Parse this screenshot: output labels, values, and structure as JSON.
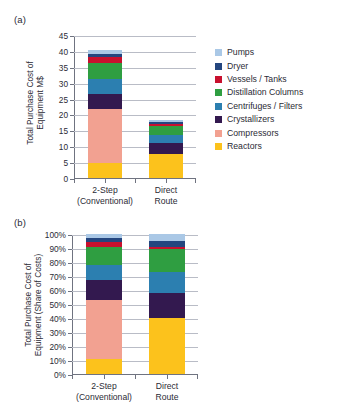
{
  "figure": {
    "panel_a_label": "(a)",
    "panel_b_label": "(b)"
  },
  "legend": {
    "items": [
      {
        "label": "Pumps",
        "color": "#aac8e6"
      },
      {
        "label": "Dryer",
        "color": "#24467f"
      },
      {
        "label": "Vessels / Tanks",
        "color": "#c8102e"
      },
      {
        "label": "Distillation Columns",
        "color": "#2f9e41"
      },
      {
        "label": "Centrifuges / Filters",
        "color": "#2c7fb0"
      },
      {
        "label": "Crystallizers",
        "color": "#33194f"
      },
      {
        "label": "Compressors",
        "color": "#f2a191"
      },
      {
        "label": "Reactors",
        "color": "#fcc21c"
      }
    ]
  },
  "chart_data": [
    {
      "type": "bar",
      "id": "panel-a",
      "title": "(a)",
      "stacked": true,
      "xlabel": "",
      "ylabel": "Total Purchase Cost of Equipment M$",
      "ylabel_lines": [
        "Total Purchase Cost of",
        "Equipment M$"
      ],
      "categories": [
        "2-Step (Conventional)",
        "Direct Route"
      ],
      "category_lines": [
        [
          "2-Step",
          "(Conventional)"
        ],
        [
          "Direct",
          "Route"
        ]
      ],
      "ylim": [
        0,
        45
      ],
      "yticks": [
        0,
        5,
        10,
        15,
        20,
        25,
        30,
        35,
        40,
        45
      ],
      "ytick_labels": [
        "0",
        "5",
        "10",
        "15",
        "20",
        "25",
        "30",
        "35",
        "40",
        "45"
      ],
      "grid": true,
      "legend_position": "right",
      "series": [
        {
          "name": "Reactors",
          "color": "#fcc21c",
          "values": [
            4.7,
            7.5
          ]
        },
        {
          "name": "Compressors",
          "color": "#f2a191",
          "values": [
            17.0,
            0.0
          ]
        },
        {
          "name": "Crystallizers",
          "color": "#33194f",
          "values": [
            4.8,
            3.5
          ]
        },
        {
          "name": "Centrifuges / Filters",
          "color": "#2c7fb0",
          "values": [
            4.7,
            2.6
          ]
        },
        {
          "name": "Distillation Columns",
          "color": "#2f9e41",
          "values": [
            5.1,
            2.9
          ]
        },
        {
          "name": "Vessels / Tanks",
          "color": "#c8102e",
          "values": [
            1.7,
            0.5
          ]
        },
        {
          "name": "Dryer",
          "color": "#24467f",
          "values": [
            1.1,
            0.6
          ]
        },
        {
          "name": "Pumps",
          "color": "#aac8e6",
          "values": [
            1.2,
            0.8
          ]
        }
      ],
      "totals": [
        40.3,
        18.4
      ]
    },
    {
      "type": "bar",
      "id": "panel-b",
      "title": "(b)",
      "stacked": true,
      "xlabel": "",
      "ylabel": "Total Purchase Cost of Equipment (Share of Costs)",
      "ylabel_lines": [
        "Total Purchase Cost of",
        "Equipment (Share of Costs)"
      ],
      "categories": [
        "2-Step (Conventional)",
        "Direct Route"
      ],
      "category_lines": [
        [
          "2-Step",
          "(Conventional)"
        ],
        [
          "Direct",
          "Route"
        ]
      ],
      "ylim": [
        0,
        100
      ],
      "yticks": [
        0,
        10,
        20,
        30,
        40,
        50,
        60,
        70,
        80,
        90,
        100
      ],
      "ytick_labels": [
        "0%",
        "10%",
        "20%",
        "30%",
        "40%",
        "50%",
        "60%",
        "70%",
        "80%",
        "90%",
        "100%"
      ],
      "grid": true,
      "legend_position": "right",
      "series": [
        {
          "name": "Reactors",
          "color": "#fcc21c",
          "values": [
            11.0,
            40.0
          ]
        },
        {
          "name": "Compressors",
          "color": "#f2a191",
          "values": [
            42.0,
            0.0
          ]
        },
        {
          "name": "Crystallizers",
          "color": "#33194f",
          "values": [
            14.0,
            18.0
          ]
        },
        {
          "name": "Centrifuges / Filters",
          "color": "#2c7fb0",
          "values": [
            11.0,
            15.0
          ]
        },
        {
          "name": "Distillation Columns",
          "color": "#2f9e41",
          "values": [
            13.0,
            16.0
          ]
        },
        {
          "name": "Vessels / Tanks",
          "color": "#c8102e",
          "values": [
            3.0,
            2.0
          ]
        },
        {
          "name": "Dryer",
          "color": "#24467f",
          "values": [
            3.0,
            4.0
          ]
        },
        {
          "name": "Pumps",
          "color": "#aac8e6",
          "values": [
            3.0,
            5.0
          ]
        }
      ],
      "totals": [
        100,
        100
      ]
    }
  ]
}
